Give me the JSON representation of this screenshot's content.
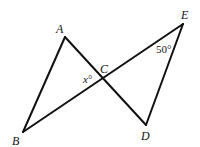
{
  "diagram": {
    "type": "geometry",
    "points": {
      "A": {
        "label": "A",
        "x": 65,
        "y": 37,
        "lx": 56,
        "ly": 33
      },
      "B": {
        "label": "B",
        "x": 23,
        "y": 132,
        "lx": 12,
        "ly": 145
      },
      "C": {
        "label": "C",
        "x": 103,
        "y": 78,
        "lx": 100,
        "ly": 73
      },
      "D": {
        "label": "D",
        "x": 146,
        "y": 125,
        "lx": 141,
        "ly": 140
      },
      "E": {
        "label": "E",
        "x": 183,
        "y": 24,
        "lx": 181,
        "ly": 19
      }
    },
    "segments": [
      {
        "from": "A",
        "to": "B"
      },
      {
        "from": "A",
        "to": "D"
      },
      {
        "from": "B",
        "to": "E"
      },
      {
        "from": "E",
        "to": "D"
      }
    ],
    "angles": {
      "x": {
        "label": "x°",
        "at": "C",
        "lx": 83,
        "ly": 83
      },
      "e": {
        "label": "50°",
        "at": "E",
        "lx": 156,
        "ly": 53
      }
    },
    "colors": {
      "stroke": "#111111",
      "background": "#ffffff"
    }
  }
}
